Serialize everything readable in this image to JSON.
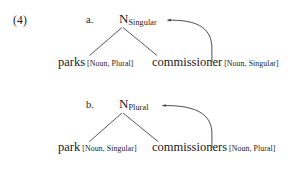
{
  "example": {
    "number": "(4)"
  },
  "colors": {
    "ink": "#1a1a1a",
    "line": "#3a3a3a",
    "background": "#ffffff"
  },
  "subexamples": [
    {
      "label": "a.",
      "mother": {
        "category": "N",
        "feature_subscript": "Singular"
      },
      "terminals": [
        {
          "word": "parks",
          "features": "[Noun, Plural]"
        },
        {
          "word": "commissioner",
          "features": "[Noun, Singular]"
        }
      ],
      "agreement_arrow": {
        "from": "commissioner",
        "to": "N",
        "direction": "left",
        "arrowhead": "left-arrowhead"
      }
    },
    {
      "label": "b.",
      "mother": {
        "category": "N",
        "feature_subscript": "Plural"
      },
      "terminals": [
        {
          "word": "park",
          "features": "[Noun, Singular]"
        },
        {
          "word": "commissioners",
          "features": "[Noun, Plural]"
        }
      ],
      "agreement_arrow": {
        "from": "commissioners",
        "to": "N",
        "direction": "left",
        "arrowhead": "left-arrowhead"
      }
    }
  ]
}
